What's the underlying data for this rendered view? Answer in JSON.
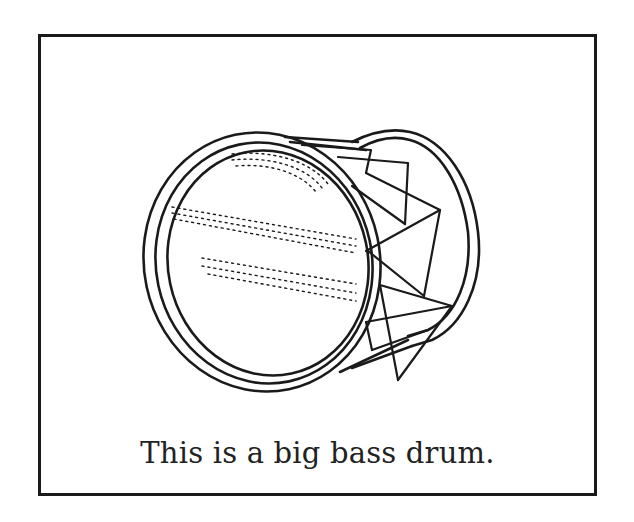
{
  "figure": {
    "subject": "big bass drum",
    "caption": "This is a big bass drum.",
    "style": "black line-art illustration in a bordered box",
    "colors": {
      "line": "#1a1a1a",
      "background": "#ffffff",
      "text": "#222222"
    }
  }
}
